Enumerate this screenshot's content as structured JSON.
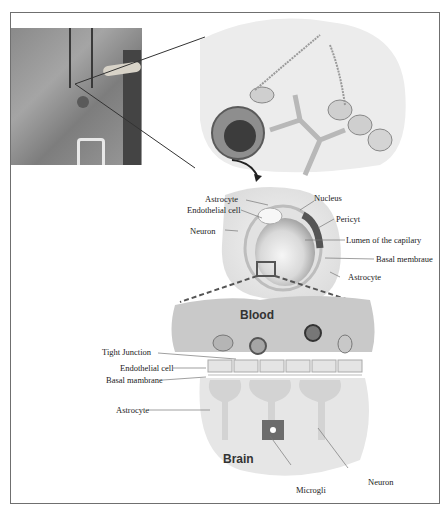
{
  "figure": {
    "title": "",
    "photo": {
      "description": "Grayscale surgical photo with highlighted brain capillary point"
    },
    "top_illustration": {
      "description": "Capillary surrounded by astrocyte end-feet"
    },
    "cross_section": {
      "labels": {
        "astrocyte_top": "Astrocyte",
        "endothelial_cell": "Endothelial cell",
        "neuron": "Neuron",
        "nucleus": "Nucleus",
        "pericyte": "Pericyt",
        "lumen": "Lumen of the capilary",
        "basal_membrane": "Basal membraue",
        "astrocyte_bottom": "Astrocyte"
      }
    },
    "bbb_detail": {
      "regions": {
        "blood": "Blood",
        "brain": "Brain"
      },
      "labels": {
        "tight_junction": "Tight Junction",
        "endothelial_cell": "Endothelial cell",
        "basal_membrane": "Basal mambrane",
        "astrocyte": "Astrocyte",
        "microglia": "Microgli",
        "neuron": "Neuron"
      }
    }
  }
}
